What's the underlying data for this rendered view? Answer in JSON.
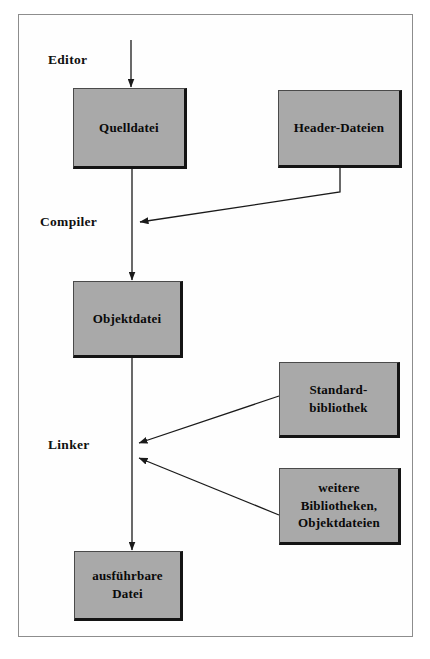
{
  "figure": {
    "kind": "flow-diagram",
    "title_visible": false,
    "background_color": "#ffffff",
    "frame_color": "#8d8d8d",
    "box_fill_color": "#a9a9a9",
    "box_shadow_color": "#141414",
    "line_color": "#1a1a1a"
  },
  "stage_labels": [
    {
      "id": "editor",
      "text": "Editor"
    },
    {
      "id": "compiler",
      "text": "Compiler"
    },
    {
      "id": "linker",
      "text": "Linker"
    }
  ],
  "nodes": [
    {
      "id": "quelldatei",
      "lines": [
        "Quelldatei"
      ]
    },
    {
      "id": "header-dateien",
      "lines": [
        "Header-Dateien"
      ]
    },
    {
      "id": "objektdatei",
      "lines": [
        "Objektdatei"
      ]
    },
    {
      "id": "standardbibliothek",
      "lines": [
        "Standard-",
        "bibliothek"
      ]
    },
    {
      "id": "weitere-bibliotheken",
      "lines": [
        "weitere",
        "Bibliotheken,",
        "Objektdateien"
      ]
    },
    {
      "id": "ausfuehrbare-datei",
      "lines": [
        "ausführbare",
        "Datei"
      ]
    }
  ],
  "edges": [
    {
      "id": "edge-editor-to-quelldatei",
      "from": "editor-source",
      "to": "quelldatei"
    },
    {
      "id": "edge-quelldatei-to-objektdatei",
      "from": "quelldatei",
      "to": "objektdatei"
    },
    {
      "id": "edge-header-to-compiler",
      "from": "header-dateien",
      "to": "compiler-junction"
    },
    {
      "id": "edge-objektdatei-to-ausfuehrbare",
      "from": "objektdatei",
      "to": "ausfuehrbare-datei"
    },
    {
      "id": "edge-standardbibliothek-to-linker",
      "from": "standardbibliothek",
      "to": "linker-junction"
    },
    {
      "id": "edge-weitere-to-linker",
      "from": "weitere-bibliotheken",
      "to": "linker-junction"
    }
  ]
}
